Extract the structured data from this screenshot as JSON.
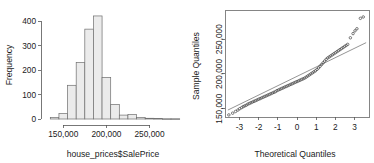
{
  "figure": {
    "title": "",
    "panels": 2,
    "background": "#ffffff",
    "bar_fill": "#ebebeb",
    "bar_stroke": "#6e6e6e",
    "point_color": "#4d4d4d",
    "line_color": "#4d4d4d"
  },
  "chart_data": [
    {
      "type": "bar",
      "id": "histogram-saleprice",
      "title": "",
      "xlabel": "house_prices$SalePrice",
      "ylabel": "Frequency",
      "xlim": [
        130000,
        290000
      ],
      "ylim": [
        0,
        430
      ],
      "grid": false,
      "legend": null,
      "xtick_values": [
        150000,
        200000,
        250000
      ],
      "xtick_labels": [
        "150,000",
        "200,000",
        "250,000"
      ],
      "ytick_values": [
        0,
        100,
        200,
        300,
        400
      ],
      "ytick_labels": [
        "0",
        "100",
        "200",
        "300",
        "400"
      ],
      "bin_width": 10000,
      "bin_starts": [
        135000,
        145000,
        155000,
        165000,
        175000,
        185000,
        195000,
        205000,
        215000,
        225000,
        235000,
        245000,
        255000,
        265000,
        275000
      ],
      "categories": [
        "135k-145k",
        "145k-155k",
        "155k-165k",
        "165k-175k",
        "175k-185k",
        "185k-195k",
        "195k-205k",
        "205k-215k",
        "215k-225k",
        "225k-235k",
        "235k-245k",
        "245k-255k",
        "255k-265k",
        "265k-275k",
        "275k-285k"
      ],
      "values": [
        6,
        22,
        138,
        231,
        368,
        422,
        170,
        60,
        16,
        18,
        6,
        3,
        2,
        1,
        1
      ]
    },
    {
      "type": "scatter",
      "id": "normal-qq-plot",
      "title": "",
      "xlabel": "Theoretical Quantiles",
      "ylabel": "Sample Quantiles",
      "xlim": [
        -3.75,
        3.75
      ],
      "ylim": [
        138000,
        292000
      ],
      "grid": false,
      "legend": null,
      "xtick_values": [
        -3,
        -2,
        -1,
        0,
        1,
        2,
        3
      ],
      "xtick_labels": [
        "-3",
        "-2",
        "-1",
        "0",
        "1",
        "2",
        "3"
      ],
      "ytick_values": [
        150000,
        200000,
        250000
      ],
      "ytick_labels": [
        "150,000",
        "200,000",
        "250,000"
      ],
      "reference_line": {
        "x": [
          -3.6,
          3.6
        ],
        "y": [
          148000,
          245000
        ]
      },
      "x": [
        -3.55,
        -3.35,
        -3.2,
        -3.08,
        -2.98,
        -2.88,
        -2.8,
        -2.72,
        -2.64,
        -2.56,
        -2.48,
        -2.4,
        -2.32,
        -2.24,
        -2.16,
        -2.08,
        -2.0,
        -1.92,
        -1.84,
        -1.76,
        -1.68,
        -1.6,
        -1.52,
        -1.44,
        -1.36,
        -1.28,
        -1.2,
        -1.12,
        -1.04,
        -0.96,
        -0.88,
        -0.8,
        -0.72,
        -0.64,
        -0.56,
        -0.48,
        -0.4,
        -0.32,
        -0.24,
        -0.16,
        -0.08,
        0.0,
        0.08,
        0.16,
        0.24,
        0.32,
        0.4,
        0.48,
        0.56,
        0.64,
        0.72,
        0.8,
        0.88,
        0.96,
        1.04,
        1.12,
        1.2,
        1.28,
        1.36,
        1.44,
        1.52,
        1.6,
        1.68,
        1.76,
        1.84,
        1.92,
        2.0,
        2.08,
        2.16,
        2.24,
        2.32,
        2.4,
        2.48,
        2.56,
        2.64,
        2.78,
        2.92,
        3.02,
        3.12,
        3.3,
        3.45
      ],
      "y": [
        141000,
        143500,
        146000,
        148000,
        150000,
        151500,
        153000,
        154000,
        155000,
        156500,
        157500,
        158500,
        159500,
        160500,
        161500,
        162500,
        163500,
        164500,
        165500,
        166500,
        167500,
        168500,
        169500,
        170500,
        171500,
        172500,
        173500,
        174500,
        176000,
        177000,
        178000,
        179000,
        180000,
        181000,
        182000,
        183000,
        184000,
        185000,
        186000,
        187000,
        188000,
        189000,
        190000,
        191000,
        192000,
        193000,
        194000,
        195500,
        197000,
        198500,
        200000,
        201500,
        203000,
        204500,
        206500,
        208500,
        211000,
        213500,
        216000,
        218500,
        221000,
        223000,
        224500,
        226000,
        227500,
        229000,
        230500,
        232000,
        233500,
        235000,
        236500,
        238000,
        239500,
        241000,
        242500,
        252000,
        258000,
        262000,
        265000,
        280000,
        282000
      ]
    }
  ]
}
